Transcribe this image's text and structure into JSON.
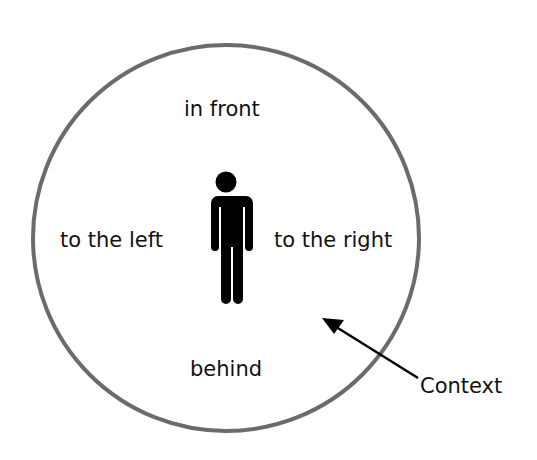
{
  "diagram": {
    "labels": {
      "front": "in front",
      "left": "to the left",
      "right": "to the right",
      "behind": "behind",
      "context": "Context"
    },
    "icons": {
      "person": "person-icon",
      "arrow": "arrow-icon"
    },
    "colors": {
      "circle": "#6b6b6b",
      "figure": "#000000",
      "text": "#111111"
    }
  }
}
